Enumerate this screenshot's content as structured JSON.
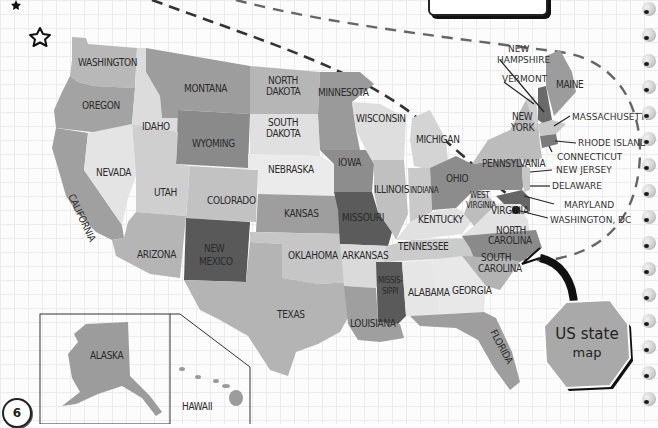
{
  "page": {
    "number": "6",
    "title_tab_text": "",
    "badge": {
      "line1": "US state",
      "line2": "map"
    }
  },
  "states": {
    "washington": "WASHINGTON",
    "oregon": "OREGON",
    "california": "CALIFORNIA",
    "idaho": "IDAHO",
    "nevada": "NEVADA",
    "montana": "MONTANA",
    "wyoming": "WYOMING",
    "utah": "UTAH",
    "arizona": "ARIZONA",
    "colorado": "COLORADO",
    "new_mexico_1": "NEW",
    "new_mexico_2": "MEXICO",
    "north_dakota_1": "NORTH",
    "north_dakota_2": "DAKOTA",
    "south_dakota_1": "SOUTH",
    "south_dakota_2": "DAKOTA",
    "nebraska": "NEBRASKA",
    "kansas": "KANSAS",
    "oklahoma": "OKLAHOMA",
    "texas": "TEXAS",
    "minnesota": "MINNESOTA",
    "iowa": "IOWA",
    "missouri": "MISSOURI",
    "arkansas": "ARKANSAS",
    "louisiana": "LOUISIANA",
    "wisconsin": "WISCONSIN",
    "illinois": "ILLINOIS",
    "mississippi_1": "MISSIS-",
    "mississippi_2": "SIPPI",
    "michigan": "MICHIGAN",
    "indiana": "INDIANA",
    "kentucky": "KENTUCKY",
    "tennessee": "TENNESSEE",
    "alabama": "ALABAMA",
    "ohio": "OHIO",
    "west_virginia_1": "WEST",
    "west_virginia_2": "VIRGINIA",
    "virginia": "VIRGINIA",
    "north_carolina_1": "NORTH",
    "north_carolina_2": "CAROLINA",
    "south_carolina_1": "SOUTH",
    "south_carolina_2": "CAROLINA",
    "georgia": "GEORGIA",
    "florida": "FLORIDA",
    "pennsylvania": "PENNSYLVANIA",
    "new_york_1": "NEW",
    "new_york_2": "YORK",
    "maine": "MAINE",
    "alaska": "ALASKA",
    "hawaii": "HAWAII"
  },
  "callouts": {
    "new_hampshire_1": "NEW",
    "new_hampshire_2": "HAMPSHIRE",
    "vermont": "VERMONT",
    "massachusetts": "MASSACHUSETTS",
    "rhode_island": "RHODE ISLAND",
    "connecticut": "CONNECTICUT",
    "new_jersey": "NEW JERSEY",
    "delaware": "DELAWARE",
    "maryland": "MARYLAND",
    "washington_dc": "WASHINGTON, DC"
  },
  "colors": {
    "light": "#e6e6e6",
    "mid_light": "#c4c4c4",
    "mid": "#a9a9a9",
    "mid_dark": "#8f8f8f",
    "dark": "#5e5e5e",
    "text": "#2a2a2a"
  }
}
